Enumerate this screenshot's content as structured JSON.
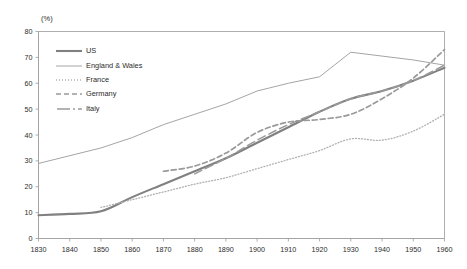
{
  "chart_data": {
    "type": "line",
    "title": "",
    "subtitle": "",
    "xlabel": "",
    "ylabel": "",
    "unit_label": "(%)",
    "xlim": [
      1830,
      1960
    ],
    "ylim": [
      0,
      80
    ],
    "xticks": [
      1830,
      1840,
      1850,
      1860,
      1870,
      1880,
      1890,
      1900,
      1910,
      1920,
      1930,
      1940,
      1950,
      1960
    ],
    "yticks": [
      0,
      10,
      20,
      30,
      40,
      50,
      60,
      70,
      80
    ],
    "grid": false,
    "legend_position": "upper-left",
    "series": [
      {
        "name": "US",
        "style": "solid-thick",
        "color": "#808080",
        "width": 2.1,
        "x": [
          1830,
          1840,
          1850,
          1860,
          1870,
          1880,
          1890,
          1900,
          1910,
          1920,
          1930,
          1940,
          1950,
          1960
        ],
        "y": [
          9,
          9.5,
          10.5,
          16,
          21,
          26,
          31,
          37,
          43,
          49,
          54,
          57,
          61,
          66
        ]
      },
      {
        "name": "England & Wales",
        "style": "solid-thin",
        "color": "#9a9a9a",
        "width": 0.9,
        "x": [
          1830,
          1840,
          1850,
          1860,
          1870,
          1880,
          1890,
          1900,
          1910,
          1920,
          1930,
          1940,
          1950,
          1960
        ],
        "y": [
          29,
          32,
          35,
          39,
          44,
          48,
          52,
          57,
          60,
          62.5,
          72,
          70.5,
          69,
          67
        ]
      },
      {
        "name": "France",
        "style": "dotted",
        "color": "#b0b0b0",
        "width": 1.3,
        "x": [
          1830,
          1840,
          1850,
          1860,
          1870,
          1880,
          1890,
          1900,
          1910,
          1920,
          1930,
          1940,
          1950,
          1960
        ],
        "y": [
          null,
          null,
          12,
          15,
          18,
          21,
          23.5,
          27,
          30.5,
          34,
          38.5,
          38,
          41.5,
          48
        ]
      },
      {
        "name": "Germany",
        "style": "dashed",
        "color": "#9a9a9a",
        "width": 1.7,
        "x": [
          1830,
          1840,
          1850,
          1860,
          1870,
          1880,
          1890,
          1900,
          1910,
          1920,
          1930,
          1940,
          1950,
          1960
        ],
        "y": [
          null,
          null,
          null,
          null,
          26,
          28,
          33,
          41,
          45,
          46,
          48,
          54,
          62,
          73
        ]
      },
      {
        "name": "Italy",
        "style": "long-dash",
        "color": "#9a9a9a",
        "width": 1.5,
        "x": [
          1830,
          1840,
          1850,
          1860,
          1870,
          1880,
          1890,
          1900,
          1910,
          1920,
          1930,
          1940,
          1950,
          1960
        ],
        "y": [
          null,
          null,
          null,
          null,
          null,
          25,
          31,
          38,
          44,
          49,
          54,
          57,
          61,
          67
        ]
      }
    ]
  },
  "legend": {
    "items": [
      {
        "label": "US",
        "swatch": "solid-thick"
      },
      {
        "label": "England & Wales",
        "swatch": "solid-thin"
      },
      {
        "label": "France",
        "swatch": "dotted"
      },
      {
        "label": "Germany",
        "swatch": "dashed"
      },
      {
        "label": "Italy",
        "swatch": "long-dash"
      }
    ]
  },
  "axes": {
    "unit_label": "(%)",
    "y_tick_labels": [
      "80",
      "70",
      "60",
      "50",
      "40",
      "30",
      "20",
      "10",
      "0"
    ],
    "x_tick_labels": [
      "1830",
      "1840",
      "1850",
      "1860",
      "1870",
      "1880",
      "1890",
      "1900",
      "1910",
      "1920",
      "1930",
      "1940",
      "1950",
      "1960"
    ]
  },
  "colors": {
    "axis": "#9a9a9a",
    "text": "#2b2b2b",
    "us": "#808080",
    "england": "#9a9a9a",
    "france": "#b0b0b0",
    "germany": "#9a9a9a",
    "italy": "#9a9a9a",
    "background": "#ffffff"
  }
}
